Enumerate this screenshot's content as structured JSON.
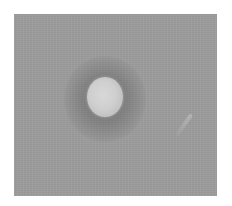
{
  "image": {
    "description": "Grayscale photograph of a single bright circular spot with a dark surrounding halo on a uniform gray background",
    "colors": {
      "page_background": "#ffffff",
      "field_gray": "#9c9c9c",
      "spot_center": "#d8d8d8",
      "halo_dark": "#5a5a5a"
    },
    "objects": [
      {
        "name": "bright-spot",
        "center": [
          104,
          97
        ],
        "radius": [
          18,
          20
        ]
      },
      {
        "name": "dark-halo",
        "center": [
          104,
          99
        ],
        "radius": [
          41,
          43
        ]
      },
      {
        "name": "faint-streak",
        "center": [
          184,
          124
        ]
      }
    ]
  }
}
